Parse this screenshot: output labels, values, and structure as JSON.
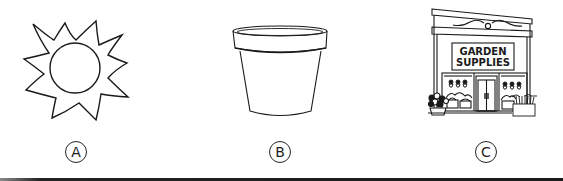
{
  "options": [
    {
      "letter": "A",
      "picture": "sun-icon",
      "description": "Sun"
    },
    {
      "letter": "B",
      "picture": "flower-pot-icon",
      "description": "Empty flower pot"
    },
    {
      "letter": "C",
      "picture": "storefront-icon",
      "description": "Garden supplies store",
      "sign_line_1": "GARDEN",
      "sign_line_2": "SUPPLIES"
    }
  ],
  "colors": {
    "line": "#1a1a1a",
    "background": "#ffffff"
  }
}
